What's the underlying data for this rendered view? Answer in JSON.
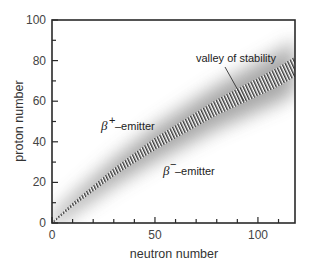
{
  "chart_data": {
    "type": "area",
    "title": "",
    "xlabel": "neutron number",
    "ylabel": "proton number",
    "xlim": [
      0,
      118
    ],
    "ylim": [
      0,
      100
    ],
    "x_major_ticks": [
      0,
      50,
      100
    ],
    "x_minor_step": 10,
    "y_major_ticks": [
      0,
      20,
      40,
      60,
      80,
      100
    ],
    "y_minor_step": 10,
    "grid": false,
    "series": [
      {
        "name": "valley of stability",
        "style": "hatched band",
        "x": [
          0,
          10,
          20,
          30,
          40,
          50,
          60,
          70,
          80,
          90,
          100,
          110,
          118
        ],
        "y": [
          0,
          9,
          17,
          25,
          32,
          39,
          45,
          51,
          57,
          62,
          67,
          72,
          77
        ],
        "half_width": [
          0.5,
          1.0,
          1.5,
          2.0,
          2.5,
          3.0,
          3.3,
          3.6,
          3.9,
          4.2,
          4.5,
          4.8,
          5.0
        ]
      }
    ],
    "annotations": [
      {
        "text": "valley of stability",
        "x": 82,
        "y": 80,
        "points_to": [
          88,
          59
        ]
      },
      {
        "text": "β+-emitter",
        "x": 28,
        "y": 40,
        "region": "above band"
      },
      {
        "text": "β−-emitter",
        "x": 60,
        "y": 25,
        "region": "below band"
      }
    ]
  },
  "labels": {
    "xlabel": "neutron number",
    "ylabel": "proton number",
    "valley": "valley of stability",
    "beta": "β",
    "plus_sup": "+",
    "minus_sup": "−",
    "emitter": "–emitter",
    "x_ticks": [
      "0",
      "50",
      "100"
    ],
    "y_ticks": [
      "0",
      "20",
      "40",
      "60",
      "80",
      "100"
    ]
  }
}
